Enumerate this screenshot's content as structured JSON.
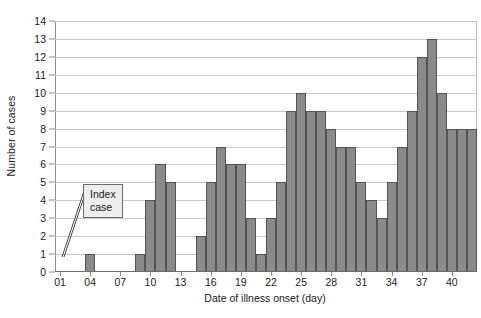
{
  "chart_data": {
    "type": "bar",
    "title": "",
    "subtitle": "",
    "xlabel": "Date of illness onset (day)",
    "ylabel": "Number of cases",
    "ylim": [
      0,
      14
    ],
    "ytick_step": 1,
    "yticks": [
      0,
      1,
      2,
      3,
      4,
      5,
      6,
      7,
      8,
      9,
      10,
      11,
      12,
      13,
      14
    ],
    "ytick_labels": [
      "0",
      "1",
      "2",
      "3",
      "4",
      "5",
      "6",
      "7",
      "8",
      "9",
      "10",
      "11",
      "12",
      "13",
      "14"
    ],
    "xlim": [
      1,
      42
    ],
    "xtick_labels": [
      "01",
      "04",
      "07",
      "10",
      "13",
      "16",
      "19",
      "22",
      "25",
      "28",
      "31",
      "34",
      "37",
      "40"
    ],
    "xticks": [
      1,
      4,
      7,
      10,
      13,
      16,
      19,
      22,
      25,
      28,
      31,
      34,
      37,
      40
    ],
    "grid": "horizontal",
    "legend": "none",
    "bar_color": "#8a8a8a",
    "bar_edge_color": "#545454",
    "gridline_color": "#c9c9c9",
    "axis_color": "#8e8e8e",
    "categories": [
      1,
      2,
      3,
      4,
      5,
      6,
      7,
      8,
      9,
      10,
      11,
      12,
      13,
      14,
      15,
      16,
      17,
      18,
      19,
      20,
      21,
      22,
      23,
      24,
      25,
      26,
      27,
      28,
      29,
      30,
      31,
      32,
      33,
      34,
      35,
      36,
      37,
      38,
      39,
      40,
      41,
      42
    ],
    "values": [
      0,
      0,
      0,
      1,
      0,
      0,
      0,
      0,
      1,
      4,
      6,
      5,
      0,
      0,
      2,
      5,
      7,
      6,
      6,
      3,
      1,
      3,
      5,
      9,
      10,
      9,
      9,
      8,
      7,
      7,
      5,
      4,
      3,
      5,
      7,
      9,
      12,
      13,
      10,
      8,
      8,
      8
    ],
    "annotations": [
      {
        "text": "Index\ncase",
        "points_to_day": 4,
        "points_to_value": 1
      }
    ]
  },
  "annotation": {
    "index_case_label": "Index\ncase"
  }
}
